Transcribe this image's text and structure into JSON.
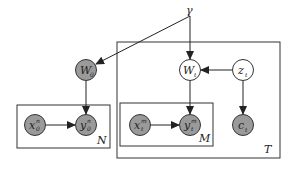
{
  "diagram": {
    "type": "probabilistic-graphical-model",
    "colors": {
      "observed_fill": "#9a9a9a",
      "latent_fill": "#ffffff",
      "stroke": "#333333",
      "background": "#ffffff"
    },
    "hyperparameter": {
      "id": "gamma",
      "label": "γ"
    },
    "nodes": [
      {
        "id": "W0",
        "base": "W",
        "sub": "0",
        "sup": "",
        "observed": true
      },
      {
        "id": "x0n",
        "base": "x",
        "sub": "0",
        "sup": "n",
        "observed": true
      },
      {
        "id": "y0n",
        "base": "y",
        "sub": "0",
        "sup": "n",
        "observed": true
      },
      {
        "id": "Wt",
        "base": "W",
        "sub": "t",
        "sup": "",
        "observed": false
      },
      {
        "id": "zt",
        "base": "z",
        "sub": "t",
        "sup": "",
        "observed": false
      },
      {
        "id": "xtm",
        "base": "x",
        "sub": "t",
        "sup": "m",
        "observed": true
      },
      {
        "id": "ytm",
        "base": "y",
        "sub": "t",
        "sup": "m",
        "observed": true
      },
      {
        "id": "ct",
        "base": "c",
        "sub": "t",
        "sup": "",
        "observed": true
      }
    ],
    "edges": [
      {
        "from": "gamma",
        "to": "W0"
      },
      {
        "from": "gamma",
        "to": "Wt"
      },
      {
        "from": "W0",
        "to": "y0n"
      },
      {
        "from": "x0n",
        "to": "y0n"
      },
      {
        "from": "zt",
        "to": "Wt"
      },
      {
        "from": "Wt",
        "to": "ytm"
      },
      {
        "from": "xtm",
        "to": "ytm"
      },
      {
        "from": "zt",
        "to": "ct"
      }
    ],
    "plates": [
      {
        "id": "plate-N",
        "label": "N",
        "contains": [
          "x0n",
          "y0n"
        ]
      },
      {
        "id": "plate-T",
        "label": "T",
        "contains": [
          "Wt",
          "zt",
          "ct",
          "plate-M"
        ]
      },
      {
        "id": "plate-M",
        "label": "M",
        "contains": [
          "xtm",
          "ytm"
        ]
      }
    ]
  }
}
